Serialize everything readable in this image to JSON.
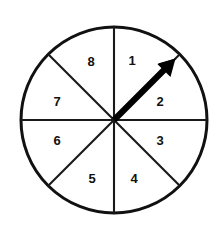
{
  "figure": {
    "name": "spinner-wheel",
    "background_color": "#ffffff",
    "outline_color": "#111111",
    "divider_color": "#1a1a1a",
    "pointer_color": "#000000",
    "label_color": "#111111"
  },
  "wheel": {
    "center_x": 114,
    "center_y": 120,
    "radius": 93,
    "sector_count": 8,
    "sectors": [
      {
        "label": "1",
        "label_x": 132,
        "label_y": 62
      },
      {
        "label": "2",
        "label_x": 160,
        "label_y": 103
      },
      {
        "label": "3",
        "label_x": 160,
        "label_y": 142
      },
      {
        "label": "4",
        "label_x": 134,
        "label_y": 180
      },
      {
        "label": "5",
        "label_x": 92,
        "label_y": 180
      },
      {
        "label": "6",
        "label_x": 57,
        "label_y": 142
      },
      {
        "label": "7",
        "label_x": 57,
        "label_y": 103
      },
      {
        "label": "8",
        "label_x": 91,
        "label_y": 63
      }
    ]
  },
  "pointer": {
    "name": "spinner-pointer",
    "points_to_sector": "1",
    "angle_degrees": 50,
    "tail_x": 114,
    "tail_y": 120,
    "tip_x": 174,
    "tip_y": 60
  }
}
